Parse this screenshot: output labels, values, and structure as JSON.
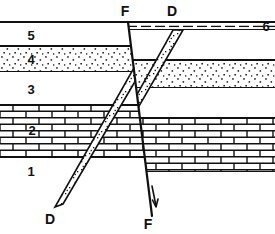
{
  "figure": {
    "width": 275,
    "height": 234,
    "background_color": "#ffffff",
    "line_color": "#111111"
  },
  "unit_labels": {
    "u1": "1",
    "u2": "2",
    "u3": "3",
    "u4": "4",
    "u5": "5",
    "u6": "6"
  },
  "structure_labels": {
    "fault_top": "F",
    "fault_bottom": "F",
    "dike_top": "D",
    "dike_bottom": "D"
  },
  "units": [
    {
      "id": "1",
      "label": "1",
      "pattern": "blank",
      "description": "lowermost unlabeled basement unit, no ornament",
      "left_top_y": 158,
      "right_top_y": 172
    },
    {
      "id": "2",
      "label": "2",
      "pattern": "brick",
      "description": "brick ornament limestone bed",
      "left_top_y": 105,
      "left_bottom_y": 158,
      "right_top_y": 118,
      "right_bottom_y": 172
    },
    {
      "id": "3",
      "label": "3",
      "pattern": "blank",
      "description": "blank shale bed",
      "left_top_y": 72,
      "left_bottom_y": 105,
      "right_top_y": 88,
      "right_bottom_y": 118
    },
    {
      "id": "4",
      "label": "4",
      "pattern": "stipple",
      "description": "stippled sandstone bed",
      "left_top_y": 46,
      "left_bottom_y": 72,
      "right_top_y": 60,
      "right_bottom_y": 88
    },
    {
      "id": "5",
      "label": "5",
      "pattern": "blank",
      "description": "blank upper bed",
      "left_top_y": 22,
      "left_bottom_y": 46,
      "right_top_y": 30,
      "right_bottom_y": 60
    },
    {
      "id": "6",
      "label": "6",
      "pattern": "dashed-bed",
      "description": "thin dashed capping bed present only right of the fault, uncut by fault and dike",
      "right_top_y": 22,
      "right_bottom_y": 30
    }
  ],
  "structures": [
    {
      "id": "fault",
      "name": "normal fault",
      "label": "F",
      "top_label": "F",
      "bottom_label": "F",
      "top_point": [
        128,
        25
      ],
      "bottom_point": [
        152,
        216
      ],
      "dip_direction": "right",
      "offset_sense": "down-to-the-right",
      "arrow": "downward displacement arrow on hanging wall",
      "cuts_units": [
        "1",
        "2",
        "3",
        "4",
        "5"
      ],
      "does_not_cut": [
        "6"
      ]
    },
    {
      "id": "dike",
      "name": "dike",
      "label": "D",
      "top_label": "D",
      "bottom_label": "D",
      "top_point": [
        180,
        24
      ],
      "bottom_point": [
        55,
        207
      ],
      "pattern": "stipple",
      "description": "tabular stippled intrusive body dipping up to the right, offset by the fault",
      "cuts_units": [
        "1",
        "2",
        "3",
        "4",
        "5"
      ],
      "does_not_cut": [
        "6"
      ]
    }
  ]
}
